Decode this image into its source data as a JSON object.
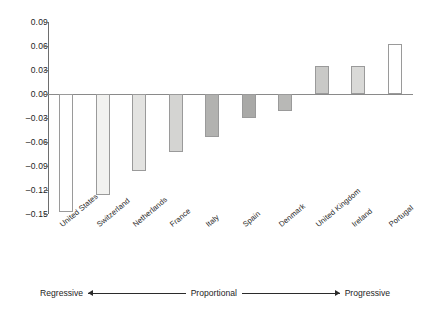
{
  "chart_data": {
    "type": "bar",
    "title": "",
    "subtitle": "",
    "xlabel": "",
    "ylabel": "",
    "grid": false,
    "legend": "none",
    "ylim": [
      -0.15,
      0.09
    ],
    "ytick_labels": [
      "0.09",
      "0.06",
      "0.03",
      "0.00",
      "-0.03",
      "-0.06",
      "-0.09",
      "-0.12",
      "-0.15"
    ],
    "ytick_values": [
      0.09,
      0.06,
      0.03,
      0.0,
      -0.03,
      -0.06,
      -0.09,
      -0.12,
      -0.15
    ],
    "categories": [
      "United States",
      "Switzerland",
      "Netherlands",
      "France",
      "Italy",
      "Spain",
      "Denmark",
      "United Kingdom",
      "Ireland",
      "Portugal"
    ],
    "values": [
      -0.147,
      -0.126,
      -0.096,
      -0.072,
      -0.054,
      -0.03,
      -0.021,
      0.035,
      0.035,
      0.063
    ],
    "bar_colors": [
      "#ffffff",
      "#f2f2f0",
      "#e3e3e1",
      "#d4d4d2",
      "#b2b2b0",
      "#a9a9a7",
      "#b8b8b6",
      "#c9c9c7",
      "#d9d9d7",
      "#ffffff"
    ]
  },
  "axis_caption": {
    "left_label": "Regressive",
    "center_label": "Proportional",
    "right_label": "Progressive"
  }
}
